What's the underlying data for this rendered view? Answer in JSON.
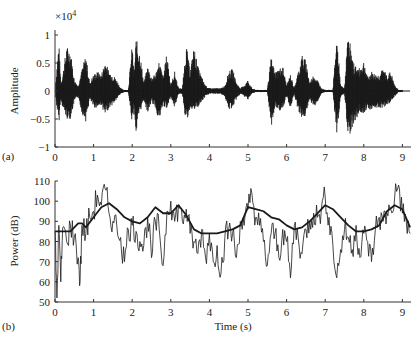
{
  "chart_data": [
    {
      "type": "line",
      "panel_label": "(a)",
      "title": "",
      "xlabel": "",
      "ylabel": "Amplitude",
      "y_multiplier": "×10⁴",
      "xlim": [
        0,
        9.2
      ],
      "ylim": [
        -1,
        1.2
      ],
      "xticks": [
        "0",
        "1",
        "2",
        "3",
        "4",
        "5",
        "6",
        "7",
        "8",
        "9"
      ],
      "yticks": [
        "−1",
        "−0.5",
        "0",
        "0.5",
        "1"
      ],
      "grid": false,
      "description": "Speech waveform with bursts of activity",
      "envelope": {
        "t": [
          0.0,
          0.1,
          0.15,
          0.2,
          0.3,
          0.4,
          0.5,
          0.6,
          0.7,
          0.8,
          0.9,
          1.0,
          1.1,
          1.2,
          1.3,
          1.4,
          1.5,
          1.6,
          1.7,
          1.8,
          1.9,
          2.0,
          2.05,
          2.1,
          2.2,
          2.3,
          2.4,
          2.5,
          2.6,
          2.7,
          2.8,
          2.9,
          3.0,
          3.1,
          3.2,
          3.3,
          3.4,
          3.5,
          3.6,
          3.7,
          3.8,
          3.9,
          4.0,
          4.1,
          4.2,
          4.3,
          4.4,
          4.5,
          4.6,
          4.7,
          4.8,
          4.9,
          5.0,
          5.1,
          5.2,
          5.3,
          5.4,
          5.5,
          5.6,
          5.7,
          5.8,
          5.9,
          6.0,
          6.1,
          6.2,
          6.3,
          6.4,
          6.5,
          6.6,
          6.7,
          6.8,
          6.9,
          7.0,
          7.1,
          7.2,
          7.3,
          7.4,
          7.5,
          7.6,
          7.7,
          7.8,
          7.9,
          8.0,
          8.1,
          8.2,
          8.3,
          8.4,
          8.5,
          8.6,
          8.7,
          8.8,
          8.9,
          9.0,
          9.1,
          9.2
        ],
        "upper": [
          0.02,
          0.9,
          0.15,
          0.3,
          0.8,
          0.75,
          0.2,
          0.1,
          0.4,
          0.65,
          0.15,
          0.3,
          0.35,
          0.3,
          0.55,
          0.35,
          0.3,
          0.2,
          0.05,
          0.02,
          0.02,
          0.85,
          0.3,
          0.95,
          0.7,
          0.15,
          0.45,
          0.25,
          0.3,
          0.55,
          0.25,
          0.7,
          0.1,
          0.35,
          0.05,
          0.05,
          0.85,
          0.35,
          0.8,
          0.45,
          0.25,
          0.1,
          0.05,
          0.05,
          0.05,
          0.05,
          0.1,
          0.35,
          0.4,
          0.15,
          0.05,
          0.1,
          0.2,
          0.05,
          0.02,
          0.02,
          0.02,
          0.02,
          0.6,
          0.35,
          0.4,
          0.45,
          0.1,
          0.3,
          0.05,
          0.35,
          0.65,
          0.55,
          0.15,
          0.3,
          0.2,
          0.05,
          0.02,
          0.02,
          0.02,
          1.0,
          0.1,
          0.05,
          1.15,
          0.55,
          0.45,
          0.4,
          0.55,
          0.25,
          0.35,
          0.3,
          0.3,
          0.4,
          0.3,
          0.35,
          0.1,
          0.02,
          0.02
        ],
        "lower": [
          -0.02,
          -0.6,
          -0.15,
          -0.3,
          -0.5,
          -0.5,
          -0.2,
          -0.1,
          -0.4,
          -0.55,
          -0.15,
          -0.3,
          -0.3,
          -0.25,
          -0.45,
          -0.3,
          -0.25,
          -0.15,
          -0.05,
          -0.02,
          -0.02,
          -0.6,
          -0.3,
          -0.8,
          -0.4,
          -0.15,
          -0.4,
          -0.2,
          -0.3,
          -0.55,
          -0.25,
          -0.35,
          -0.1,
          -0.3,
          -0.05,
          -0.05,
          -0.6,
          -0.3,
          -0.35,
          -0.3,
          -0.2,
          -0.1,
          -0.05,
          -0.05,
          -0.05,
          -0.05,
          -0.1,
          -0.35,
          -0.3,
          -0.15,
          -0.05,
          -0.1,
          -0.15,
          -0.05,
          -0.02,
          -0.02,
          -0.02,
          -0.02,
          -0.65,
          -0.3,
          -0.35,
          -0.35,
          -0.1,
          -0.3,
          -0.05,
          -0.35,
          -0.5,
          -0.45,
          -0.15,
          -0.3,
          -0.2,
          -0.05,
          -0.02,
          -0.02,
          -0.02,
          -0.8,
          -0.1,
          -0.05,
          -0.85,
          -0.65,
          -0.5,
          -0.4,
          -0.4,
          -0.3,
          -0.35,
          -0.3,
          -0.3,
          -0.3,
          -0.25,
          -0.2,
          -0.1,
          -0.02,
          -0.02
        ]
      }
    },
    {
      "type": "line",
      "panel_label": "(b)",
      "title": "",
      "xlabel": "Time (s)",
      "ylabel": "Power (dB)",
      "xlim": [
        0,
        9.2
      ],
      "ylim": [
        50,
        110
      ],
      "xticks": [
        "0",
        "1",
        "2",
        "3",
        "4",
        "5",
        "6",
        "7",
        "8",
        "9"
      ],
      "yticks": [
        "50",
        "60",
        "70",
        "80",
        "90",
        "100",
        "110"
      ],
      "grid": false,
      "series": [
        {
          "name": "smoothed power (envelope)",
          "style": "thick",
          "x": [
            0.0,
            0.2,
            0.4,
            0.6,
            0.7,
            0.8,
            1.0,
            1.2,
            1.4,
            1.6,
            1.8,
            2.0,
            2.2,
            2.4,
            2.6,
            2.8,
            3.0,
            3.2,
            3.4,
            3.6,
            3.8,
            4.0,
            4.2,
            4.4,
            4.6,
            4.8,
            5.0,
            5.2,
            5.4,
            5.6,
            5.8,
            6.0,
            6.2,
            6.4,
            6.6,
            6.8,
            7.0,
            7.2,
            7.4,
            7.6,
            7.8,
            8.0,
            8.2,
            8.4,
            8.6,
            8.8,
            9.0,
            9.2
          ],
          "y": [
            85,
            85,
            85,
            89,
            89,
            87,
            92,
            97,
            99,
            96,
            92,
            90,
            89,
            92,
            97,
            94,
            94,
            98,
            93,
            86,
            84,
            84,
            84,
            85,
            86,
            88,
            97,
            96,
            95,
            92,
            91,
            88,
            86,
            87,
            90,
            94,
            98,
            96,
            92,
            88,
            85,
            85,
            86,
            88,
            95,
            98,
            96,
            87
          ]
        },
        {
          "name": "instantaneous power",
          "style": "thin",
          "x": [
            0.0,
            0.05,
            0.1,
            0.15,
            0.2,
            0.3,
            0.4,
            0.5,
            0.6,
            0.65,
            0.7,
            0.8,
            0.9,
            1.0,
            1.1,
            1.2,
            1.3,
            1.4,
            1.5,
            1.6,
            1.7,
            1.8,
            1.9,
            2.0,
            2.1,
            2.2,
            2.3,
            2.4,
            2.5,
            2.6,
            2.7,
            2.8,
            2.9,
            3.0,
            3.1,
            3.2,
            3.3,
            3.4,
            3.5,
            3.6,
            3.7,
            3.8,
            3.9,
            4.0,
            4.1,
            4.2,
            4.3,
            4.4,
            4.5,
            4.6,
            4.7,
            4.8,
            4.9,
            5.0,
            5.1,
            5.2,
            5.3,
            5.4,
            5.5,
            5.6,
            5.7,
            5.8,
            5.9,
            6.0,
            6.1,
            6.2,
            6.3,
            6.4,
            6.5,
            6.6,
            6.7,
            6.8,
            6.9,
            7.0,
            7.1,
            7.2,
            7.3,
            7.4,
            7.5,
            7.6,
            7.7,
            7.8,
            7.9,
            8.0,
            8.1,
            8.2,
            8.3,
            8.4,
            8.5,
            8.6,
            8.7,
            8.8,
            8.9,
            9.0,
            9.1,
            9.2
          ],
          "y": [
            85,
            52,
            88,
            60,
            87,
            80,
            88,
            82,
            72,
            60,
            88,
            84,
            92,
            95,
            103,
            98,
            106,
            94,
            90,
            88,
            82,
            70,
            86,
            88,
            85,
            80,
            78,
            92,
            72,
            90,
            86,
            68,
            95,
            100,
            90,
            98,
            90,
            96,
            84,
            80,
            74,
            86,
            72,
            84,
            70,
            78,
            64,
            82,
            86,
            84,
            72,
            90,
            88,
            96,
            104,
            92,
            88,
            80,
            68,
            84,
            84,
            72,
            86,
            80,
            62,
            88,
            82,
            74,
            86,
            90,
            94,
            92,
            96,
            102,
            92,
            78,
            62,
            76,
            86,
            82,
            76,
            88,
            72,
            84,
            80,
            70,
            86,
            92,
            90,
            94,
            96,
            102,
            108,
            94,
            90,
            84
          ]
        }
      ]
    }
  ],
  "panels": {
    "a": {
      "label": "(a)",
      "ylabel": "Amplitude",
      "multiplier": "×10",
      "multiplier_exp": "4",
      "yticks": [
        {
          "v": 1,
          "label": "1"
        },
        {
          "v": 0.5,
          "label": "0.5"
        },
        {
          "v": 0,
          "label": "0"
        },
        {
          "v": -0.5,
          "label": "−0.5"
        },
        {
          "v": -1,
          "label": "−1"
        }
      ]
    },
    "b": {
      "label": "(b)",
      "ylabel": "Power (dB)",
      "xlabel": "Time (s)",
      "yticks": [
        {
          "v": 110,
          "label": "110"
        },
        {
          "v": 100,
          "label": "100"
        },
        {
          "v": 90,
          "label": "90"
        },
        {
          "v": 80,
          "label": "80"
        },
        {
          "v": 70,
          "label": "70"
        },
        {
          "v": 60,
          "label": "60"
        },
        {
          "v": 50,
          "label": "50"
        }
      ]
    },
    "xticks": [
      "0",
      "1",
      "2",
      "3",
      "4",
      "5",
      "6",
      "7",
      "8",
      "9"
    ],
    "colors": {
      "ink": "#1a1a1a",
      "axis": "#333333",
      "background": "#ffffff"
    }
  }
}
